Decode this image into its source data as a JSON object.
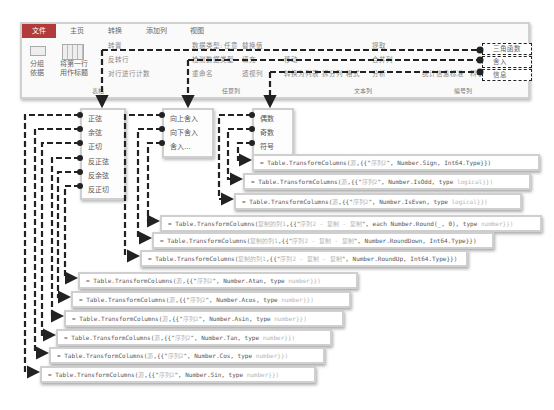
{
  "ribbon": {
    "tabs": [
      "文件",
      "主页",
      "转换",
      "添加列",
      "视图"
    ],
    "group_table": {
      "label": "表格",
      "group_by": "分组\n依据",
      "first_row_header": "将第一行\n用作标题",
      "items": [
        "转置",
        "反转行",
        "对行进行计数"
      ]
    },
    "group_any_column": {
      "label": "任意列",
      "items": [
        "数据类型: 任意",
        "检测数据类型",
        "重命名",
        "替换值",
        "填充",
        "透视列",
        "移动",
        "转换为列表"
      ]
    },
    "group_text_column": {
      "label": "文本列",
      "items": [
        "拆分列",
        "格式",
        "合并列",
        "提取",
        "分析"
      ]
    },
    "group_number_column": {
      "label": "编号列",
      "items": [
        "统计信息",
        "标准",
        "科学记数"
      ]
    },
    "dropdowns": [
      "三角函数",
      "舍入",
      "信息"
    ]
  },
  "menus": {
    "trig": [
      "正弦",
      "余弦",
      "正切",
      "反正弦",
      "反余弦",
      "反正切"
    ],
    "round": [
      "向上舍入",
      "向下舍入",
      "舍入..."
    ],
    "info": [
      "偶数",
      "奇数",
      "符号"
    ]
  },
  "formulas": {
    "info": [
      {
        "pre": "= Table.TransformColumns(",
        "src": "源",
        "mid": ",{{\"",
        "col": "序列2",
        "post": "\", Number.Sign, Int64.Type}})",
        "tail": ""
      },
      {
        "pre": "= Table.TransformColumns(",
        "src": "源",
        "mid": ",{{\"",
        "col": "序列2",
        "post": "\", Number.IsOdd, type ",
        "tail": "logical}})"
      },
      {
        "pre": "= Table.TransformColumns(",
        "src": "源",
        "mid": ",{{\"",
        "col": "序列2",
        "post": "\", Number.IsEven, type ",
        "tail": "logical}})"
      }
    ],
    "round": [
      {
        "pre": "= Table.TransformColumns(",
        "src": "复制的列1",
        "mid": ",{{\"",
        "col": "序列2 - 复制 - 复制",
        "post": "\", each Number.Round(_, 0), type ",
        "tail": "number}})"
      },
      {
        "pre": "= Table.TransformColumns(",
        "src": "复制的列1",
        "mid": ",{{\"",
        "col": "序列2 - 复制 - 复制",
        "post": "\", Number.RoundDown, Int64.Type}})",
        "tail": ""
      },
      {
        "pre": "= Table.TransformColumns(",
        "src": "复制的列1",
        "mid": ",{{\"",
        "col": "序列2 - 复制 - 复制",
        "post": "\", Number.RoundUp, Int64.Type}})",
        "tail": ""
      }
    ],
    "trig": [
      {
        "pre": "= Table.TransformColumns(",
        "src": "源",
        "mid": ",{{\"",
        "col": "序列2",
        "post": "\", Number.Atan, type ",
        "tail": "number}})"
      },
      {
        "pre": "= Table.TransformColumns(",
        "src": "源",
        "mid": ",{{\"",
        "col": "序列2",
        "post": "\", Number.Acos, type ",
        "tail": "number}})"
      },
      {
        "pre": "= Table.TransformColumns(",
        "src": "源",
        "mid": ",{{\"",
        "col": "序列2",
        "post": "\", Number.Asin, type ",
        "tail": "number}})"
      },
      {
        "pre": "= Table.TransformColumns(",
        "src": "源",
        "mid": ",{{\"",
        "col": "序列2",
        "post": "\", Number.Tan, type ",
        "tail": "number}})"
      },
      {
        "pre": "= Table.TransformColumns(",
        "src": "源",
        "mid": ",{{\"",
        "col": "序列2",
        "post": "\", Number.Cos, type ",
        "tail": "number}})"
      },
      {
        "pre": "= Table.TransformColumns(",
        "src": "源",
        "mid": ",{{\"",
        "col": "序列2",
        "post": "\", Number.Sin, type ",
        "tail": "number}})"
      }
    ]
  }
}
